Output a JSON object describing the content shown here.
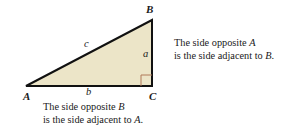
{
  "figure": {
    "background_color": "#ffffff"
  },
  "triangle": {
    "fill_color": "#ece5c8",
    "stroke_color": "#111111",
    "stroke_width": 2,
    "vertices": [
      {
        "name": "A",
        "x": 26,
        "y": 86
      },
      {
        "name": "B",
        "x": 152,
        "y": 20
      },
      {
        "name": "C",
        "x": 152,
        "y": 86
      }
    ],
    "right_angle_marker": {
      "at_vertex": "C",
      "color": "#b07a5a",
      "size": 11
    }
  },
  "vertex_labels": {
    "a": "A",
    "b": "B",
    "c": "C"
  },
  "side_labels": {
    "hypotenuse": "c",
    "vertical": "a",
    "horizontal": "b"
  },
  "captions": {
    "right": {
      "line1_prefix": "The side opposite ",
      "line1_var": "A",
      "line2_prefix": "is the side adjacent to ",
      "line2_var": "B",
      "line2_suffix": "."
    },
    "bottom": {
      "line1_prefix": "The side opposite ",
      "line1_var": "B",
      "line2_prefix": "is the side adjacent to ",
      "line2_var": "A",
      "line2_suffix": "."
    }
  }
}
